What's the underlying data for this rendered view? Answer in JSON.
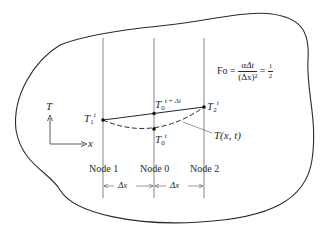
{
  "figure": {
    "formula": {
      "lhs": "Fo",
      "eq": "=",
      "numerator": "αΔt",
      "denominator": "(Δx)²",
      "eq2": "=",
      "half_num": "1",
      "half_den": "2"
    },
    "axes": {
      "y_label": "T",
      "x_label": "x"
    },
    "points": {
      "t1": {
        "base": "T",
        "sub": "1",
        "sup": "t"
      },
      "t2": {
        "base": "T",
        "sub": "2",
        "sup": "t"
      },
      "t0_next": {
        "base": "T",
        "sub": "0",
        "sup": "t + Δt"
      },
      "t0": {
        "base": "T",
        "sub": "0",
        "sup": "t"
      }
    },
    "curve_label": "T(x, t)",
    "nodes": [
      "Node 1",
      "Node 0",
      "Node 2"
    ],
    "spacing": [
      "Δx",
      "Δx"
    ],
    "colors": {
      "ink": "#2a2a2a",
      "background": "#ffffff"
    }
  }
}
